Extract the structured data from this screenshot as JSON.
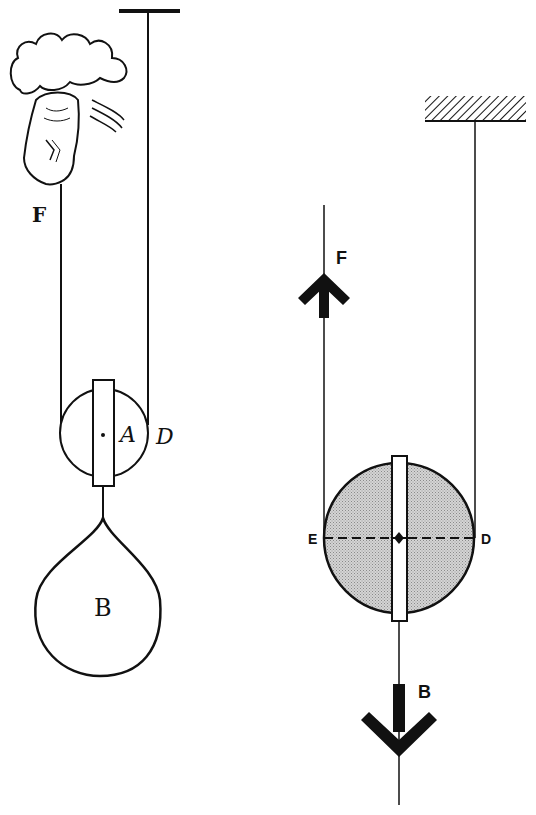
{
  "diagram": {
    "type": "movable-pulley-comparison",
    "background": "#ffffff",
    "ink_color": "#111111",
    "pulley_fill": "#c8c8c8",
    "left_figure": {
      "style": "historical engraving",
      "labels": {
        "force": "F",
        "axle": "A",
        "rim_point": "D",
        "weight": "B"
      },
      "elements": [
        "ceiling-bar",
        "hand-pulling-rope",
        "movable-pulley",
        "teardrop-weight"
      ]
    },
    "right_figure": {
      "style": "modern schematic",
      "labels": {
        "force": "F",
        "left_point": "E",
        "right_point": "D",
        "weight": "B"
      },
      "elements": [
        "hatched-ceiling",
        "force-arrow-up",
        "shaded-pulley",
        "dashed-lever-line-ED",
        "weight-arrow-down"
      ]
    }
  }
}
